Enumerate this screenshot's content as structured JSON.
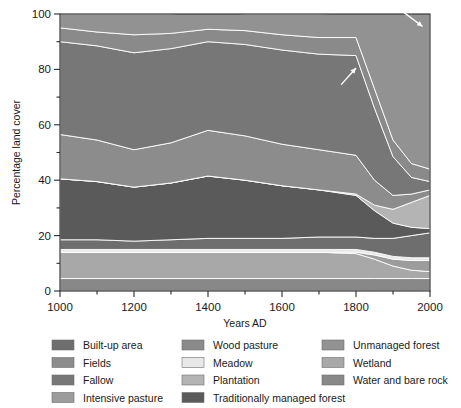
{
  "figure": {
    "background": "#ffffff",
    "plot_bg": "#808080"
  },
  "axes": {
    "x": {
      "label": "Years AD",
      "min": 1000,
      "max": 2000,
      "tick_step": 100,
      "labeled_ticks": [
        "1000",
        "1200",
        "1400",
        "1600",
        "1800",
        "2000"
      ],
      "labeled_tick_values": [
        1000,
        1200,
        1400,
        1600,
        1800,
        2000
      ]
    },
    "y": {
      "label": "Percentage land cover",
      "min": 0,
      "max": 100,
      "tick_step": 10,
      "labeled_ticks": [
        "0",
        "20",
        "40",
        "60",
        "80",
        "100"
      ],
      "labeled_tick_values": [
        0,
        20,
        40,
        60,
        80,
        100
      ]
    }
  },
  "legend": {
    "columns": [
      [
        {
          "label": "Built-up area",
          "color": "#6e6e6e"
        },
        {
          "label": "Fields",
          "color": "#8c8c8c"
        },
        {
          "label": "Fallow",
          "color": "#777777"
        },
        {
          "label": "Intensive pasture",
          "color": "#9c9c9c"
        }
      ],
      [
        {
          "label": "Wood pasture",
          "color": "#8a8a8a"
        },
        {
          "label": "Meadow",
          "color": "#e8e8e8"
        },
        {
          "label": "Plantation",
          "color": "#b4b4b4"
        },
        {
          "label": "Traditionally managed forest",
          "color": "#5a5a5a"
        }
      ],
      [
        {
          "label": "Unmanaged forest",
          "color": "#929292"
        },
        {
          "label": "Wetland",
          "color": "#a8a8a8"
        },
        {
          "label": "Water and bare rock",
          "color": "#888888"
        }
      ]
    ]
  },
  "annotations": [
    {
      "name": "arrow-plantation",
      "points_to": "Plantation band",
      "x": 1795,
      "y": 80
    },
    {
      "name": "arrow-built-up",
      "points_to": "Built-up area band",
      "x": 1975,
      "y": 96
    }
  ],
  "chart_data": {
    "type": "area",
    "title": "",
    "xlabel": "Years AD",
    "ylabel": "Percentage land cover",
    "xlim": [
      1000,
      2000
    ],
    "ylim": [
      0,
      100
    ],
    "grid": false,
    "legend_position": "below",
    "stacked": true,
    "x": [
      1000,
      1100,
      1200,
      1300,
      1400,
      1500,
      1600,
      1700,
      1800,
      1850,
      1900,
      1950,
      2000
    ],
    "stack_order_bottom_to_top": [
      "Water and bare rock",
      "Wetland",
      "Intensive pasture",
      "Meadow",
      "Built-up area",
      "Traditionally managed forest",
      "Plantation",
      "Fields",
      "Fallow",
      "Wood pasture",
      "Unmanaged forest"
    ],
    "series": [
      {
        "name": "Water and bare rock",
        "color": "#888888",
        "values": [
          4.5,
          4.5,
          4.5,
          4.5,
          4.5,
          4.5,
          4.5,
          4.5,
          4.5,
          4.5,
          4.5,
          4.5,
          4.5
        ]
      },
      {
        "name": "Wetland",
        "color": "#a8a8a8",
        "values": [
          9.5,
          9.5,
          9.5,
          9.5,
          9.5,
          9.5,
          9.5,
          9.5,
          9.0,
          7.0,
          4.5,
          3.0,
          2.5
        ]
      },
      {
        "name": "Intensive pasture",
        "color": "#9c9c9c",
        "values": [
          0.0,
          0.0,
          0.0,
          0.0,
          0.0,
          0.0,
          0.0,
          0.0,
          0.5,
          1.5,
          2.5,
          3.5,
          4.0
        ]
      },
      {
        "name": "Meadow",
        "color": "#e8e8e8",
        "values": [
          1.0,
          1.0,
          1.0,
          1.0,
          1.0,
          1.0,
          1.0,
          1.0,
          1.0,
          1.0,
          1.0,
          1.0,
          1.0
        ]
      },
      {
        "name": "Built-up area",
        "color": "#6e6e6e",
        "values": [
          3.5,
          3.5,
          3.0,
          3.5,
          4.0,
          4.0,
          4.0,
          4.5,
          4.5,
          5.0,
          6.5,
          8.0,
          9.0
        ]
      },
      {
        "name": "Traditionally managed forest",
        "color": "#5a5a5a",
        "values": [
          22.0,
          21.0,
          19.5,
          20.5,
          22.5,
          21.0,
          19.0,
          17.0,
          15.0,
          10.0,
          5.5,
          3.0,
          1.5
        ]
      },
      {
        "name": "Plantation",
        "color": "#b4b4b4",
        "values": [
          0.0,
          0.0,
          0.0,
          0.0,
          0.0,
          0.0,
          0.0,
          0.0,
          0.5,
          2.0,
          5.0,
          9.0,
          12.0
        ]
      },
      {
        "name": "Fields",
        "color": "#8c8c8c",
        "values": [
          16.0,
          15.0,
          13.5,
          14.5,
          16.5,
          16.0,
          15.0,
          14.5,
          14.0,
          9.0,
          5.0,
          3.0,
          2.0
        ]
      },
      {
        "name": "Fallow",
        "color": "#777777",
        "values": [
          33.5,
          34.0,
          35.0,
          34.0,
          32.0,
          33.0,
          34.0,
          34.5,
          36.0,
          26.0,
          14.0,
          6.0,
          3.0
        ]
      },
      {
        "name": "Wood pasture",
        "color": "#8a8a8a",
        "values": [
          5.0,
          5.0,
          6.5,
          5.5,
          4.5,
          5.0,
          5.5,
          6.0,
          6.5,
          7.0,
          6.0,
          5.0,
          4.5
        ]
      },
      {
        "name": "Unmanaged forest",
        "color": "#929292",
        "values": [
          5.0,
          6.5,
          7.5,
          7.0,
          6.5,
          6.0,
          7.5,
          8.5,
          9.0,
          31.0,
          50.0,
          54.0,
          60.0
        ]
      }
    ]
  }
}
